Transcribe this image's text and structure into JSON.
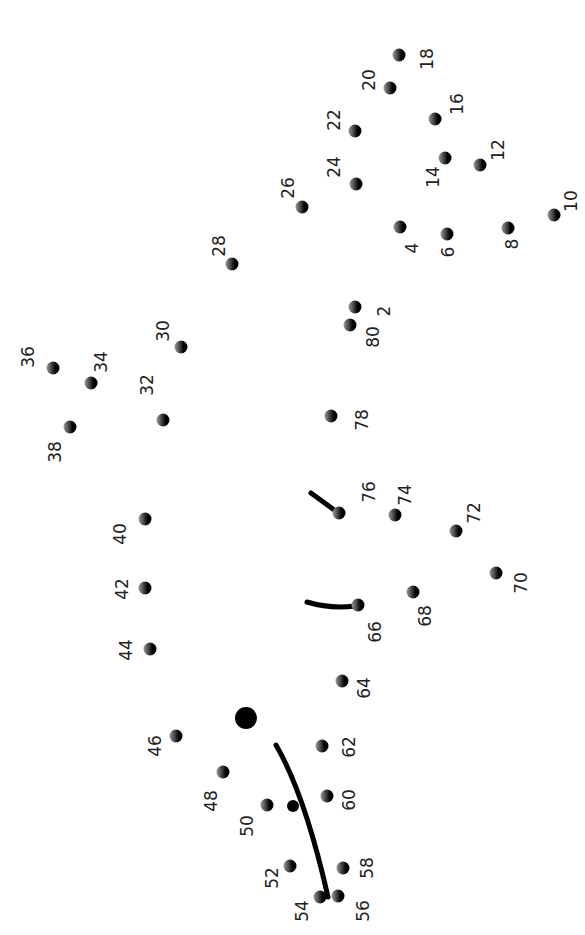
{
  "colors": {
    "dot": "#000000",
    "label": "#222222",
    "line": "#000000",
    "background": "#ffffff"
  },
  "dots": [
    {
      "n": "2",
      "x": 355,
      "y": 307,
      "lx": 384,
      "ly": 311
    },
    {
      "n": "4",
      "x": 400,
      "y": 227,
      "lx": 412,
      "ly": 248
    },
    {
      "n": "6",
      "x": 447,
      "y": 234,
      "lx": 448,
      "ly": 252
    },
    {
      "n": "8",
      "x": 508,
      "y": 228,
      "lx": 512,
      "ly": 244
    },
    {
      "n": "10",
      "x": 554,
      "y": 215,
      "lx": 571,
      "ly": 201
    },
    {
      "n": "12",
      "x": 480,
      "y": 165,
      "lx": 498,
      "ly": 150
    },
    {
      "n": "14",
      "x": 445,
      "y": 158,
      "lx": 433,
      "ly": 177
    },
    {
      "n": "16",
      "x": 435,
      "y": 119,
      "lx": 457,
      "ly": 104
    },
    {
      "n": "18",
      "x": 399,
      "y": 55,
      "lx": 427,
      "ly": 59
    },
    {
      "n": "20",
      "x": 390,
      "y": 88,
      "lx": 369,
      "ly": 80
    },
    {
      "n": "22",
      "x": 355,
      "y": 131,
      "lx": 334,
      "ly": 120
    },
    {
      "n": "24",
      "x": 356,
      "y": 184,
      "lx": 334,
      "ly": 167
    },
    {
      "n": "26",
      "x": 302,
      "y": 207,
      "lx": 288,
      "ly": 188
    },
    {
      "n": "28",
      "x": 232,
      "y": 264,
      "lx": 219,
      "ly": 246
    },
    {
      "n": "30",
      "x": 181,
      "y": 347,
      "lx": 163,
      "ly": 331
    },
    {
      "n": "32",
      "x": 163,
      "y": 420,
      "lx": 147,
      "ly": 385
    },
    {
      "n": "34",
      "x": 91,
      "y": 383,
      "lx": 101,
      "ly": 362
    },
    {
      "n": "36",
      "x": 53,
      "y": 368,
      "lx": 28,
      "ly": 357
    },
    {
      "n": "38",
      "x": 70,
      "y": 427,
      "lx": 55,
      "ly": 452
    },
    {
      "n": "40",
      "x": 145,
      "y": 519,
      "lx": 120,
      "ly": 534
    },
    {
      "n": "42",
      "x": 145,
      "y": 588,
      "lx": 122,
      "ly": 589
    },
    {
      "n": "44",
      "x": 150,
      "y": 649,
      "lx": 126,
      "ly": 650
    },
    {
      "n": "46",
      "x": 176,
      "y": 736,
      "lx": 155,
      "ly": 746
    },
    {
      "n": "48",
      "x": 223,
      "y": 772,
      "lx": 211,
      "ly": 801
    },
    {
      "n": "50",
      "x": 267,
      "y": 805,
      "lx": 247,
      "ly": 826
    },
    {
      "n": "52",
      "x": 290,
      "y": 866,
      "lx": 272,
      "ly": 878
    },
    {
      "n": "54",
      "x": 320,
      "y": 897,
      "lx": 302,
      "ly": 911
    },
    {
      "n": "56",
      "x": 338,
      "y": 896,
      "lx": 363,
      "ly": 911
    },
    {
      "n": "58",
      "x": 343,
      "y": 868,
      "lx": 367,
      "ly": 868
    },
    {
      "n": "60",
      "x": 327,
      "y": 796,
      "lx": 349,
      "ly": 800
    },
    {
      "n": "62",
      "x": 322,
      "y": 746,
      "lx": 349,
      "ly": 747
    },
    {
      "n": "64",
      "x": 342,
      "y": 681,
      "lx": 364,
      "ly": 688
    },
    {
      "n": "66",
      "x": 358,
      "y": 605,
      "lx": 375,
      "ly": 632
    },
    {
      "n": "68",
      "x": 413,
      "y": 592,
      "lx": 425,
      "ly": 616
    },
    {
      "n": "70",
      "x": 496,
      "y": 573,
      "lx": 521,
      "ly": 583
    },
    {
      "n": "72",
      "x": 456,
      "y": 531,
      "lx": 474,
      "ly": 513
    },
    {
      "n": "74",
      "x": 395,
      "y": 515,
      "lx": 405,
      "ly": 495
    },
    {
      "n": "76",
      "x": 339,
      "y": 513,
      "lx": 369,
      "ly": 492
    },
    {
      "n": "78",
      "x": 331,
      "y": 416,
      "lx": 362,
      "ly": 420
    },
    {
      "n": "80",
      "x": 350,
      "y": 325,
      "lx": 373,
      "ly": 337
    }
  ],
  "fixed_marks": {
    "eye": {
      "x": 246,
      "y": 718,
      "r": 11
    },
    "small_dot": {
      "x": 293,
      "y": 806,
      "r": 6
    },
    "mouth_curve": "M276,745 Q305,795 328,897",
    "ear_line_76": "M311,493 L337,512",
    "ear_line_66": "M307,602 Q330,609 355,606"
  }
}
